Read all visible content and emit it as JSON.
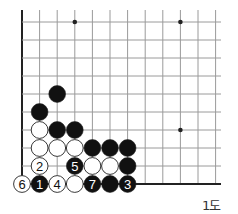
{
  "diagram": {
    "caption": "1도",
    "grid": {
      "cols": 12,
      "rows": 10,
      "origin_x": 22,
      "origin_y": 22,
      "dx": 17.6,
      "dy": 18,
      "line_right_x": 221
    },
    "edges": {
      "left": true,
      "bottom": true
    },
    "star_points": [
      {
        "col": 3,
        "row": 0
      },
      {
        "col": 9,
        "row": 0
      },
      {
        "col": 9,
        "row": 6
      }
    ],
    "colors": {
      "line": "#9a9a9a",
      "edge": "#222222",
      "black": "#111111",
      "white": "#ffffff",
      "stone_outline": "#222222"
    },
    "stones": [
      {
        "col": 2,
        "row": 4,
        "color": "black",
        "label": ""
      },
      {
        "col": 1,
        "row": 5,
        "color": "black",
        "label": ""
      },
      {
        "col": 1,
        "row": 6,
        "color": "white",
        "label": ""
      },
      {
        "col": 2,
        "row": 6,
        "color": "black",
        "label": ""
      },
      {
        "col": 3,
        "row": 6,
        "color": "black",
        "label": ""
      },
      {
        "col": 1,
        "row": 7,
        "color": "white",
        "label": ""
      },
      {
        "col": 2,
        "row": 7,
        "color": "white",
        "label": ""
      },
      {
        "col": 3,
        "row": 7,
        "color": "white",
        "label": ""
      },
      {
        "col": 4,
        "row": 7,
        "color": "black",
        "label": ""
      },
      {
        "col": 5,
        "row": 7,
        "color": "black",
        "label": ""
      },
      {
        "col": 6,
        "row": 7,
        "color": "black",
        "label": ""
      },
      {
        "col": 1,
        "row": 8,
        "color": "white",
        "label": "2"
      },
      {
        "col": 3,
        "row": 8,
        "color": "black",
        "label": "5"
      },
      {
        "col": 4,
        "row": 8,
        "color": "white",
        "label": ""
      },
      {
        "col": 5,
        "row": 8,
        "color": "white",
        "label": ""
      },
      {
        "col": 6,
        "row": 8,
        "color": "black",
        "label": ""
      },
      {
        "col": 0,
        "row": 9,
        "color": "white",
        "label": "6"
      },
      {
        "col": 1,
        "row": 9,
        "color": "black",
        "label": "1"
      },
      {
        "col": 2,
        "row": 9,
        "color": "white",
        "label": "4"
      },
      {
        "col": 3,
        "row": 9,
        "color": "white",
        "label": ""
      },
      {
        "col": 4,
        "row": 9,
        "color": "black",
        "label": "7"
      },
      {
        "col": 5,
        "row": 9,
        "color": "black",
        "label": ""
      },
      {
        "col": 6,
        "row": 9,
        "color": "black",
        "label": "3"
      }
    ]
  }
}
